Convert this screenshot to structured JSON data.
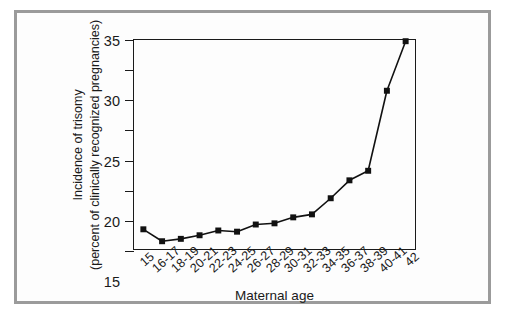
{
  "figure": {
    "background_color": "#ffffff",
    "frame_color": "#9b9b9b",
    "axis_color": "#1a1a1a",
    "marker_color": "#111111"
  },
  "chart_data": {
    "type": "line",
    "title": "",
    "xlabel": "Maternal age",
    "ylabel": "Incidence of trisomy (percent of clinically recognized pregnancies)",
    "ylabel_line1": "Incidence of trisomy",
    "ylabel_line2": "(percent of clinically recognized pregnancies)",
    "categories": [
      "15",
      "16-17",
      "18-19",
      "20-21",
      "22-23",
      "24-25",
      "26-27",
      "28-29",
      "30-31",
      "32-33",
      "34-35",
      "36-37",
      "38-39",
      "40-41",
      "42"
    ],
    "values": [
      3.3,
      1.3,
      1.7,
      2.3,
      3.1,
      2.9,
      4.1,
      4.3,
      5.3,
      5.8,
      8.5,
      11.5,
      13.1,
      26.5,
      34.8
    ],
    "ylim": [
      0,
      35
    ],
    "yticks": [
      0,
      5,
      10,
      15,
      20,
      25,
      30,
      35
    ],
    "ytick_labels": [
      "0",
      "5",
      "10",
      "15",
      "20",
      "25",
      "30",
      "35"
    ],
    "grid": false,
    "legend": null,
    "marker": "square",
    "series_name": "Incidence of trisomy"
  }
}
